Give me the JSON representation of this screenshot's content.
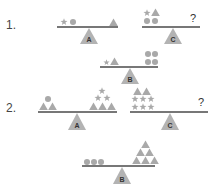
{
  "colors": {
    "shape": "#a9a9a9",
    "beam": "#4a4a4a",
    "fulcrum": "#b3b3b3",
    "text": "#444444"
  },
  "puzzles": [
    {
      "number": "1.",
      "balances": [
        {
          "label": "A",
          "left": [
            "star",
            "circle"
          ],
          "right": [
            "triangle"
          ]
        },
        {
          "label": "C",
          "left": [
            "star",
            "circle",
            "triangle",
            "circle"
          ],
          "right": "?"
        },
        {
          "label": "B",
          "left": [
            "star",
            "triangle"
          ],
          "right": [
            "circle",
            "circle",
            "circle",
            "circle"
          ]
        }
      ]
    },
    {
      "number": "2.",
      "balances": [
        {
          "label": "A",
          "left": [
            "circle",
            "triangle",
            "triangle"
          ],
          "right": [
            "star",
            "star",
            "star",
            "triangle",
            "triangle",
            "triangle"
          ]
        },
        {
          "label": "C",
          "left": [
            "triangle",
            "triangle",
            "star",
            "star",
            "star",
            "star",
            "star",
            "star"
          ],
          "right": "?"
        },
        {
          "label": "B",
          "left": [
            "circle",
            "circle",
            "circle"
          ],
          "right": [
            "triangle",
            "triangle",
            "triangle",
            "triangle",
            "triangle",
            "triangle"
          ]
        }
      ]
    }
  ],
  "labels": {
    "p1": "1.",
    "p2": "2.",
    "p1A": "A",
    "p1B": "B",
    "p1C": "C",
    "p2A": "A",
    "p2B": "B",
    "p2C": "C",
    "unknown": "?"
  }
}
